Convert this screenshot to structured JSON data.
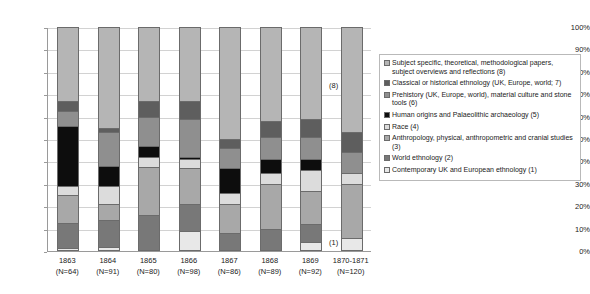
{
  "chart_data": {
    "type": "bar",
    "subtype": "stacked-100-percent",
    "title": "",
    "xlabel": "",
    "ylabel": "",
    "ylim": [
      0,
      100
    ],
    "ytick_labels": [
      "0%",
      "10%",
      "20%",
      "30%",
      "40%",
      "50%",
      "60%",
      "70%",
      "80%",
      "90%",
      "100%"
    ],
    "ytick_values": [
      0,
      10,
      20,
      30,
      40,
      50,
      60,
      70,
      80,
      90,
      100
    ],
    "grid": true,
    "legend_position": "right",
    "categories": [
      "1863\n(N=64)",
      "1864\n(N=91)",
      "1865\n(N=80)",
      "1866\n(N=98)",
      "1867\n(N=86)",
      "1868\n(N=89)",
      "1869\n(N=92)",
      "1870-1871\n(N=120)"
    ],
    "category_years": [
      "1863",
      "1864",
      "1865",
      "1866",
      "1867",
      "1868",
      "1869",
      "1870-1871"
    ],
    "category_counts": [
      "(N=64)",
      "(N=91)",
      "(N=80)",
      "(N=98)",
      "(N=86)",
      "(N=89)",
      "(N=92)",
      "(N=120)"
    ],
    "series": [
      {
        "name": "Contemporary UK and European ethnology (1)",
        "key": 1,
        "color": "#e8e8e8",
        "values": [
          1.5,
          2,
          0,
          9,
          0,
          0,
          4,
          6
        ]
      },
      {
        "name": "World ethnology (2)",
        "key": 2,
        "color": "#787878",
        "values": [
          11,
          12,
          16,
          12,
          8,
          10,
          8,
          0
        ]
      },
      {
        "name": "Anthropology, physical, anthropometric and cranial studies (3)",
        "key": 3,
        "color": "#a8a8a8",
        "values": [
          12.5,
          7,
          21.5,
          16,
          13,
          20,
          15,
          24
        ]
      },
      {
        "name": "Race (4)",
        "key": 4,
        "color": "#dcdcdc",
        "values": [
          4,
          8,
          4.5,
          4,
          5,
          5,
          9,
          5
        ]
      },
      {
        "name": "Human origins and Palaeolithic archaeology (5)",
        "key": 5,
        "color": "#0d0d0d",
        "values": [
          27,
          9,
          5,
          1,
          11,
          6,
          5,
          0
        ]
      },
      {
        "name": "Prehistory (UK, Europe, world), material culture and stone tools (6)",
        "key": 6,
        "color": "#8f8f8f",
        "values": [
          6.5,
          15,
          13,
          17,
          9,
          10,
          10,
          9
        ]
      },
      {
        "name": "Classical or historical ethnology (UK, Europe, world; 7)",
        "key": 7,
        "color": "#5e5e5e",
        "values": [
          4.5,
          2,
          7,
          8,
          4,
          7,
          8,
          9
        ]
      },
      {
        "name": "Subject specific, theoretical, methodological papers, subject overviews and reflections (8)",
        "key": 8,
        "color": "#b5b5b5",
        "values": [
          33,
          45,
          33,
          33,
          50,
          42,
          41,
          47
        ]
      }
    ],
    "annotations": [
      {
        "text": "(8)",
        "target": "top-segment"
      },
      {
        "text": "(1)",
        "target": "bottom-segment"
      }
    ]
  },
  "legend": {
    "items": [
      {
        "label": "Subject specific, theoretical, methodological papers, subject overviews and reflections (8)",
        "color": "#b5b5b5"
      },
      {
        "label": "Classical or historical ethnology (UK, Europe, world; 7)",
        "color": "#5e5e5e"
      },
      {
        "label": "Prehistory (UK, Europe, world), material culture and stone tools (6)",
        "color": "#8f8f8f"
      },
      {
        "label": "Human origins and Palaeolithic archaeology (5)",
        "color": "#0d0d0d"
      },
      {
        "label": "Race (4)",
        "color": "#dcdcdc"
      },
      {
        "label": "Anthropology, physical, anthropometric and cranial studies (3)",
        "color": "#a8a8a8"
      },
      {
        "label": "World ethnology (2)",
        "color": "#787878"
      },
      {
        "label": "Contemporary UK and European ethnology (1)",
        "color": "#e8e8e8"
      }
    ]
  },
  "annotations": {
    "segment_eight": "(8)",
    "segment_one": "(1)"
  }
}
